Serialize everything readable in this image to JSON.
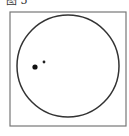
{
  "caption": "图 5",
  "diagram": {
    "frame": {
      "x": 10,
      "y": 12,
      "width": 116,
      "height": 114,
      "stroke": "#777777"
    },
    "circle": {
      "cx": 68,
      "cy": 66,
      "r": 51,
      "stroke": "#333333"
    },
    "dots": [
      {
        "label": "large-dot",
        "cx": 35,
        "cy": 67,
        "r": 2.6,
        "fill": "#111111"
      },
      {
        "label": "small-dot",
        "cx": 44,
        "cy": 62,
        "r": 1.4,
        "fill": "#222222"
      }
    ]
  }
}
